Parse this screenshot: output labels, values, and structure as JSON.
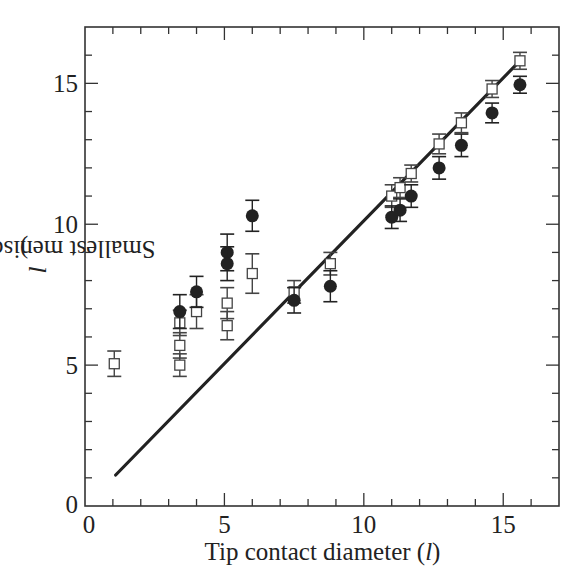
{
  "chart_data": {
    "type": "scatter",
    "title": "",
    "xlabel": "Tip contact diameter (l)",
    "ylabel": "Smallest meniscus width (l)",
    "xlim": [
      0,
      17
    ],
    "ylim": [
      0,
      17
    ],
    "x_ticks_major": [
      0,
      5,
      10,
      15
    ],
    "y_ticks_major": [
      0,
      5,
      10,
      15
    ],
    "x_tick_labels": [
      "0",
      "5",
      "10",
      "15"
    ],
    "y_tick_labels": [
      "0",
      "5",
      "10",
      "15"
    ],
    "minor_tick_step": 1,
    "grid": false,
    "legend": null,
    "series": [
      {
        "name": "filled circles",
        "marker": "filled-circle",
        "color": "#222222",
        "points": [
          {
            "x": 3.4,
            "y": 6.9,
            "err": 0.6
          },
          {
            "x": 4.0,
            "y": 7.6,
            "err": 0.55
          },
          {
            "x": 5.1,
            "y": 9.0,
            "err": 0.65
          },
          {
            "x": 5.1,
            "y": 8.6,
            "err": 0.6
          },
          {
            "x": 6.0,
            "y": 10.3,
            "err": 0.55
          },
          {
            "x": 7.5,
            "y": 7.3,
            "err": 0.45
          },
          {
            "x": 8.8,
            "y": 7.8,
            "err": 0.55
          },
          {
            "x": 11.0,
            "y": 10.25,
            "err": 0.4
          },
          {
            "x": 11.3,
            "y": 10.5,
            "err": 0.4
          },
          {
            "x": 11.7,
            "y": 11.0,
            "err": 0.4
          },
          {
            "x": 12.7,
            "y": 12.0,
            "err": 0.4
          },
          {
            "x": 13.5,
            "y": 12.8,
            "err": 0.4
          },
          {
            "x": 14.6,
            "y": 13.95,
            "err": 0.35
          },
          {
            "x": 15.6,
            "y": 14.95,
            "err": 0.3
          }
        ]
      },
      {
        "name": "open squares",
        "marker": "open-square",
        "color": "#444444",
        "points": [
          {
            "x": 1.05,
            "y": 5.05,
            "err": 0.45
          },
          {
            "x": 3.4,
            "y": 6.5,
            "err": 0.45
          },
          {
            "x": 3.4,
            "y": 5.7,
            "err": 0.45
          },
          {
            "x": 3.4,
            "y": 5.0,
            "err": 0.4
          },
          {
            "x": 4.0,
            "y": 6.9,
            "err": 0.6
          },
          {
            "x": 5.1,
            "y": 7.2,
            "err": 0.55
          },
          {
            "x": 5.1,
            "y": 6.4,
            "err": 0.5
          },
          {
            "x": 6.0,
            "y": 8.25,
            "err": 0.7
          },
          {
            "x": 7.5,
            "y": 7.6,
            "err": 0.4
          },
          {
            "x": 8.8,
            "y": 8.6,
            "err": 0.4
          },
          {
            "x": 11.0,
            "y": 11.0,
            "err": 0.4
          },
          {
            "x": 11.3,
            "y": 11.3,
            "err": 0.35
          },
          {
            "x": 11.7,
            "y": 11.8,
            "err": 0.3
          },
          {
            "x": 12.7,
            "y": 12.85,
            "err": 0.35
          },
          {
            "x": 13.5,
            "y": 13.6,
            "err": 0.35
          },
          {
            "x": 14.6,
            "y": 14.8,
            "err": 0.3
          },
          {
            "x": 15.6,
            "y": 15.8,
            "err": 0.3
          }
        ]
      },
      {
        "name": "fit line",
        "marker": "line",
        "color": "#222222",
        "x": [
          1.1,
          15.6
        ],
        "y": [
          1.1,
          15.8
        ]
      }
    ]
  },
  "labels": {
    "x_axis": "Tip contact diameter (",
    "x_axis_unit": "l",
    "x_axis_close": ")",
    "y_axis": "Smallest meniscus width (",
    "y_axis_unit": "l",
    "y_axis_close": ")"
  }
}
